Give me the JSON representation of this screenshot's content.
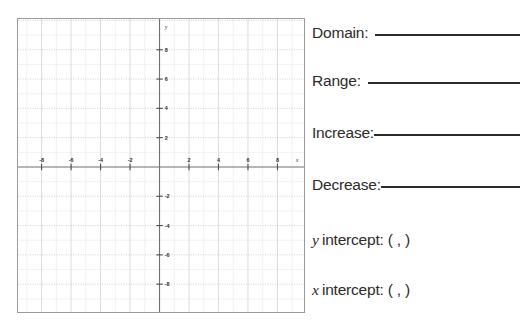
{
  "worksheet": {
    "title": "Function Analysis Worksheet"
  },
  "graph": {
    "x_axis_label": "x",
    "y_axis_label": "y",
    "x_ticks": [
      -8,
      -6,
      -4,
      -2,
      2,
      4,
      6,
      8
    ],
    "y_ticks": [
      8,
      6,
      4,
      2,
      -2,
      -4,
      -6,
      -8
    ],
    "x_tick_labels": [
      "-8",
      "-6",
      "-4",
      "-2",
      "2",
      "4",
      "6",
      "8"
    ],
    "y_tick_labels": [
      "8",
      "6",
      "4",
      "2",
      "-2",
      "-4",
      "-6",
      "-8"
    ],
    "xlim": [
      -9.6,
      9.8
    ],
    "ylim": [
      -9.9,
      10.1
    ],
    "major_grid_step": 2,
    "minor_grid_step": 1,
    "grid": true,
    "axis_color": "#6f6f74",
    "grid_major_color": "#d3d3d8",
    "grid_minor_color": "#e9e9ec",
    "border_color": "#9a9a9a",
    "plotted_curve": "none"
  },
  "prompts": {
    "domain": {
      "label": "Domain:",
      "answer": ""
    },
    "range": {
      "label": "Range:",
      "answer": ""
    },
    "increase": {
      "label": "Increase:",
      "answer": ""
    },
    "decrease": {
      "label": "Decrease:",
      "answer": ""
    },
    "y_intercept": {
      "variable": "y",
      "label": " intercept: ( ,  )",
      "answer_x": "",
      "answer_y": ""
    },
    "x_intercept": {
      "variable": "x",
      "label": " intercept: ( ,  )",
      "answer_x": "",
      "answer_y": ""
    }
  }
}
